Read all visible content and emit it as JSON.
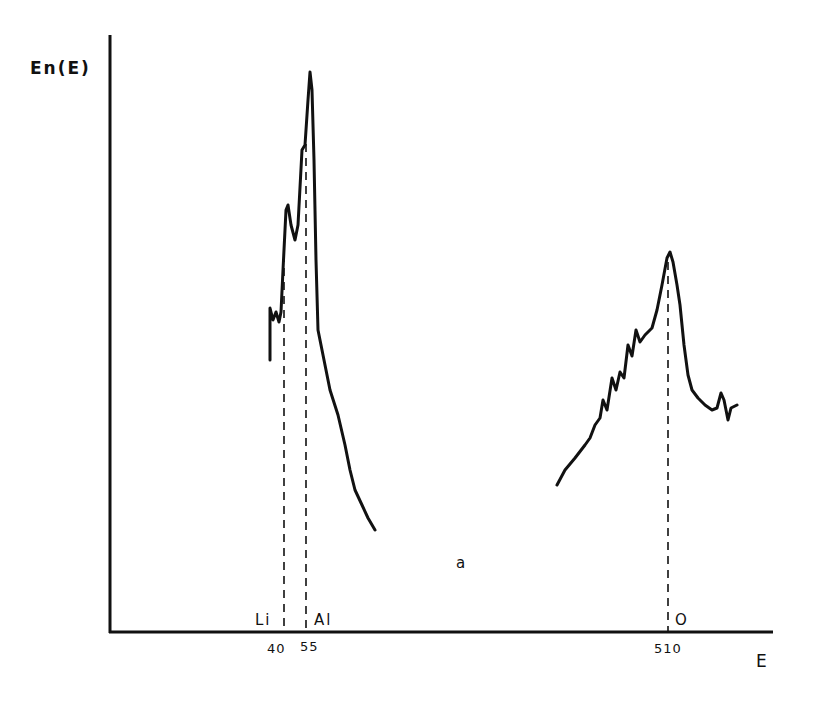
{
  "chart_data": {
    "type": "line",
    "title": "",
    "xlabel": "E",
    "ylabel": "En(E)",
    "panel_label": "a",
    "x_ticks": [
      "40",
      "55",
      "510"
    ],
    "grid": false,
    "legend": null,
    "annotations": [
      {
        "label": "Li",
        "x": 40
      },
      {
        "label": "Al",
        "x": 55
      },
      {
        "label": "O",
        "x": 510
      }
    ],
    "series": [
      {
        "name": "Li/Al region spectrum",
        "points_px": [
          [
            270,
            360
          ],
          [
            270,
            308
          ],
          [
            273,
            320
          ],
          [
            276,
            312
          ],
          [
            279,
            322
          ],
          [
            281,
            312
          ],
          [
            283,
            270
          ],
          [
            286,
            210
          ],
          [
            288,
            205
          ],
          [
            291,
            225
          ],
          [
            295,
            240
          ],
          [
            298,
            225
          ],
          [
            302,
            150
          ],
          [
            305,
            145
          ],
          [
            308,
            100
          ],
          [
            310,
            72
          ],
          [
            312,
            90
          ],
          [
            314,
            160
          ],
          [
            316,
            260
          ],
          [
            318,
            330
          ],
          [
            323,
            355
          ],
          [
            330,
            390
          ],
          [
            338,
            415
          ],
          [
            345,
            445
          ],
          [
            350,
            470
          ],
          [
            355,
            490
          ],
          [
            362,
            505
          ],
          [
            368,
            518
          ],
          [
            375,
            530
          ]
        ]
      },
      {
        "name": "O region spectrum",
        "points_px": [
          [
            557,
            485
          ],
          [
            565,
            470
          ],
          [
            575,
            458
          ],
          [
            585,
            445
          ],
          [
            590,
            438
          ],
          [
            595,
            425
          ],
          [
            600,
            418
          ],
          [
            603,
            400
          ],
          [
            607,
            410
          ],
          [
            612,
            378
          ],
          [
            616,
            390
          ],
          [
            620,
            372
          ],
          [
            624,
            378
          ],
          [
            628,
            345
          ],
          [
            632,
            356
          ],
          [
            636,
            330
          ],
          [
            640,
            342
          ],
          [
            645,
            335
          ],
          [
            652,
            328
          ],
          [
            657,
            310
          ],
          [
            662,
            285
          ],
          [
            667,
            258
          ],
          [
            670,
            252
          ],
          [
            673,
            262
          ],
          [
            677,
            285
          ],
          [
            680,
            305
          ],
          [
            684,
            345
          ],
          [
            688,
            375
          ],
          [
            692,
            390
          ],
          [
            698,
            398
          ],
          [
            705,
            405
          ],
          [
            712,
            410
          ],
          [
            717,
            408
          ],
          [
            721,
            393
          ],
          [
            724,
            400
          ],
          [
            728,
            420
          ],
          [
            731,
            408
          ],
          [
            737,
            405
          ]
        ]
      }
    ],
    "relative_peaks": [
      {
        "label": "Li",
        "energy": 40,
        "relative_height": 0.75
      },
      {
        "label": "Al",
        "energy": 55,
        "relative_height": 1.0
      },
      {
        "label": "O",
        "energy": 510,
        "relative_height": 0.66
      }
    ]
  },
  "labels": {
    "ylabel": "En(E)",
    "xlabel": "E",
    "li": "Li",
    "al": "Al",
    "o": "O",
    "tick_40": "40",
    "tick_55": "55",
    "tick_510": "510",
    "panel": "a"
  }
}
